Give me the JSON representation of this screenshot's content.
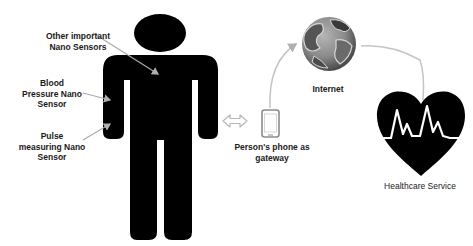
{
  "diagram": {
    "labels": {
      "other_sensors": "Other important\nNano Sensors",
      "blood_pressure": "Blood\nPressure Nano\nSensor",
      "pulse": "Pulse\nmeasuring Nano\nSensor",
      "phone": "Person's phone as\ngateway",
      "internet": "Internet",
      "healthcare": "Healthcare Service"
    },
    "icons": {
      "person": "person-silhouette-icon",
      "phone": "smartphone-icon",
      "globe": "globe-icon",
      "heart": "heart-pulse-icon",
      "link": "double-arrow-icon"
    },
    "colors": {
      "figure": "#000000",
      "arrow": "#b8b8b8",
      "phone_outline": "#8c8c8c",
      "globe_dark": "#3a3a3a",
      "globe_light": "#a8a8a8",
      "text": "#1a1a1a"
    }
  }
}
